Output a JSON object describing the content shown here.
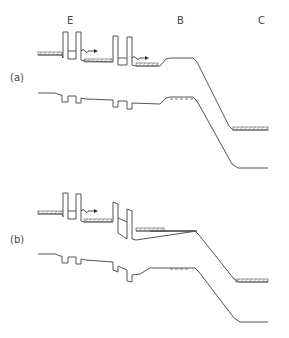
{
  "figure": {
    "region_labels": {
      "emitter": "E",
      "base": "B",
      "collector": "C"
    },
    "panels": [
      {
        "id": "a",
        "label": "(a)"
      },
      {
        "id": "b",
        "label": "(b)"
      }
    ],
    "colors": {
      "line": "#555555",
      "text": "#444444",
      "background": "#ffffff"
    }
  }
}
